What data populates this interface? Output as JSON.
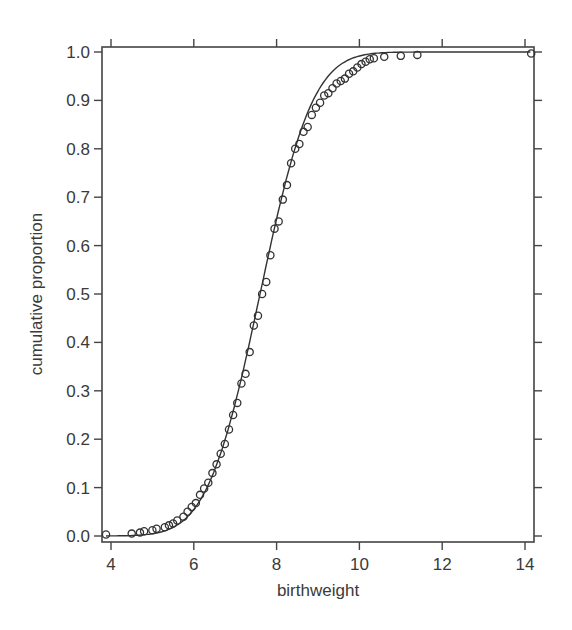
{
  "chart_data": {
    "type": "scatter",
    "title": "",
    "xlabel": "birthweight",
    "ylabel": "cumulative proportion",
    "xlim": [
      3.8,
      14.25
    ],
    "ylim": [
      -0.01,
      1.01
    ],
    "x_ticks": [
      4,
      6,
      8,
      10,
      12,
      14
    ],
    "x_tick_labels": [
      "4",
      "6",
      "8",
      "10",
      "12",
      "14"
    ],
    "y_ticks": [
      0.0,
      0.1,
      0.2,
      0.3,
      0.4,
      0.5,
      0.6,
      0.7,
      0.8,
      0.9,
      1.0
    ],
    "y_tick_labels": [
      "0.0",
      "0.1",
      "0.2",
      "0.3",
      "0.4",
      "0.5",
      "0.6",
      "0.7",
      "0.8",
      "0.9",
      "1.0"
    ],
    "grid": false,
    "legend": null,
    "series": [
      {
        "name": "empirical cumulative proportion",
        "style": "open-circles",
        "points": [
          [
            3.88,
            0.003
          ],
          [
            4.5,
            0.005
          ],
          [
            4.7,
            0.007
          ],
          [
            4.8,
            0.01
          ],
          [
            5.0,
            0.012
          ],
          [
            5.1,
            0.015
          ],
          [
            5.3,
            0.018
          ],
          [
            5.4,
            0.022
          ],
          [
            5.5,
            0.026
          ],
          [
            5.6,
            0.032
          ],
          [
            5.75,
            0.04
          ],
          [
            5.85,
            0.05
          ],
          [
            5.95,
            0.06
          ],
          [
            6.05,
            0.068
          ],
          [
            6.15,
            0.085
          ],
          [
            6.25,
            0.098
          ],
          [
            6.35,
            0.11
          ],
          [
            6.45,
            0.13
          ],
          [
            6.55,
            0.148
          ],
          [
            6.65,
            0.17
          ],
          [
            6.75,
            0.19
          ],
          [
            6.85,
            0.22
          ],
          [
            6.95,
            0.25
          ],
          [
            7.05,
            0.275
          ],
          [
            7.15,
            0.315
          ],
          [
            7.25,
            0.335
          ],
          [
            7.35,
            0.38
          ],
          [
            7.45,
            0.435
          ],
          [
            7.55,
            0.455
          ],
          [
            7.65,
            0.5
          ],
          [
            7.75,
            0.525
          ],
          [
            7.85,
            0.58
          ],
          [
            7.95,
            0.635
          ],
          [
            8.05,
            0.65
          ],
          [
            8.15,
            0.695
          ],
          [
            8.25,
            0.725
          ],
          [
            8.35,
            0.77
          ],
          [
            8.45,
            0.8
          ],
          [
            8.55,
            0.81
          ],
          [
            8.65,
            0.835
          ],
          [
            8.75,
            0.845
          ],
          [
            8.85,
            0.87
          ],
          [
            8.95,
            0.885
          ],
          [
            9.05,
            0.895
          ],
          [
            9.15,
            0.91
          ],
          [
            9.25,
            0.915
          ],
          [
            9.35,
            0.925
          ],
          [
            9.45,
            0.935
          ],
          [
            9.55,
            0.94
          ],
          [
            9.65,
            0.945
          ],
          [
            9.75,
            0.955
          ],
          [
            9.85,
            0.96
          ],
          [
            9.95,
            0.968
          ],
          [
            10.05,
            0.975
          ],
          [
            10.15,
            0.98
          ],
          [
            10.25,
            0.985
          ],
          [
            10.35,
            0.987
          ],
          [
            10.6,
            0.99
          ],
          [
            11.0,
            0.992
          ],
          [
            11.4,
            0.994
          ],
          [
            14.15,
            0.997
          ]
        ]
      },
      {
        "name": "fitted normal CDF",
        "style": "line",
        "mean": 7.6,
        "sd": 1.0,
        "x_range": [
          3.88,
          14.15
        ]
      }
    ]
  }
}
